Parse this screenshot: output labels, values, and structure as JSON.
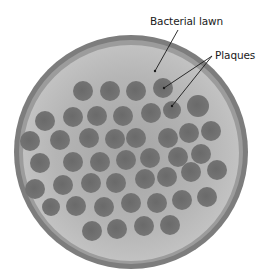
{
  "figure": {
    "labels": {
      "lawn": "Bacterial lawn",
      "plaques": "Plaques"
    },
    "colors": {
      "background": "#ffffff",
      "plate_rim": "#7a7a7a",
      "plate_rim_inner": "#9a9a9a",
      "lawn": "#b9b9b9",
      "lawn_center": "#a4a4a4",
      "plaque": "#6e6e6e",
      "plaque_dark": "#5f5f5f",
      "leader_line": "#1a1a1a"
    },
    "plate": {
      "cx": 131,
      "cy": 152,
      "r": 116
    },
    "plaques": [
      [
        83,
        91,
        10
      ],
      [
        110,
        91,
        10
      ],
      [
        136,
        91,
        10
      ],
      [
        163,
        88,
        10
      ],
      [
        45,
        121,
        10
      ],
      [
        73,
        117,
        10
      ],
      [
        97,
        116,
        10
      ],
      [
        123,
        116,
        10
      ],
      [
        151,
        113,
        10
      ],
      [
        172,
        110,
        9
      ],
      [
        198,
        106,
        11
      ],
      [
        30,
        141,
        10
      ],
      [
        60,
        140,
        10
      ],
      [
        89,
        138,
        10
      ],
      [
        115,
        139,
        10
      ],
      [
        136,
        138,
        10
      ],
      [
        168,
        138,
        10
      ],
      [
        189,
        133,
        10
      ],
      [
        211,
        131,
        10
      ],
      [
        40,
        163,
        10
      ],
      [
        73,
        162,
        10
      ],
      [
        100,
        162,
        10
      ],
      [
        126,
        160,
        10
      ],
      [
        150,
        158,
        10
      ],
      [
        178,
        157,
        10
      ],
      [
        201,
        154,
        10
      ],
      [
        35,
        189,
        10
      ],
      [
        63,
        185,
        10
      ],
      [
        91,
        183,
        10
      ],
      [
        116,
        183,
        10
      ],
      [
        145,
        179,
        10
      ],
      [
        167,
        177,
        10
      ],
      [
        191,
        172,
        10
      ],
      [
        217,
        170,
        10
      ],
      [
        51,
        207,
        9
      ],
      [
        76,
        206,
        10
      ],
      [
        104,
        207,
        10
      ],
      [
        131,
        203,
        10
      ],
      [
        157,
        203,
        10
      ],
      [
        182,
        200,
        10
      ],
      [
        207,
        197,
        10
      ],
      [
        92,
        231,
        10
      ],
      [
        117,
        229,
        10
      ],
      [
        144,
        226,
        10
      ],
      [
        170,
        225,
        10
      ]
    ]
  }
}
